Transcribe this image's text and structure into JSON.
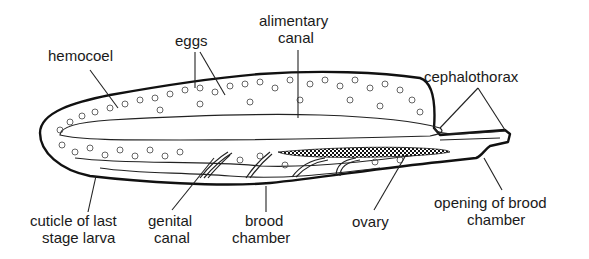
{
  "diagram": {
    "labels": {
      "hemocoel": "hemocoel",
      "eggs": "eggs",
      "alimentary_line1": "alimentary",
      "alimentary_line2": "canal",
      "cephalothorax": "cephalothorax",
      "cuticle_line1": "cuticle of last",
      "cuticle_line2": "stage larva",
      "genital_line1": "genital",
      "genital_line2": "canal",
      "brood_line1": "brood",
      "brood_line2": "chamber",
      "ovary": "ovary",
      "opening_line1": "opening of brood",
      "opening_line2": "chamber"
    },
    "colors": {
      "ink": "#1a1a1a",
      "background": "#ffffff",
      "stipple": "#9a9a9a"
    }
  }
}
